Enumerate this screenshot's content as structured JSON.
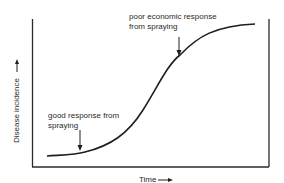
{
  "diagram": {
    "type": "disease-progress-curve",
    "axes": {
      "x_label": "Time",
      "y_label": "Disease incidence"
    },
    "annotations": [
      {
        "id": "early",
        "lines": [
          "good response from",
          "spraying"
        ]
      },
      {
        "id": "late",
        "lines": [
          "poor economic response",
          "from spraying"
        ]
      }
    ],
    "colors": {
      "line": "#1e1e1e",
      "frame": "#2a2a2a",
      "background": "#ffffff"
    }
  }
}
